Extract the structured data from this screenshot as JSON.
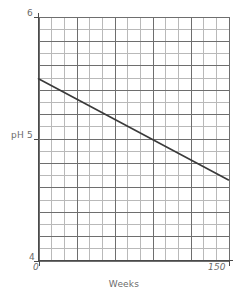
{
  "chart_data": {
    "type": "line",
    "title": "",
    "subtitle": "",
    "xlabel": "Weeks",
    "ylabel": "pH",
    "xlim": [
      0,
      150
    ],
    "ylim": [
      4,
      6
    ],
    "grid": true,
    "legend": null,
    "x_ticks": [
      {
        "value": 0,
        "label": "0"
      },
      {
        "value": 150,
        "label": "150"
      }
    ],
    "y_ticks": [
      {
        "value": 6,
        "label": "6"
      },
      {
        "value": 5,
        "label": "pH 5"
      },
      {
        "value": 4,
        "label": "4"
      }
    ],
    "grid_columns": 15,
    "grid_rows": 20,
    "major_grid_every_column": 3,
    "major_grid_every_row": 2,
    "series": [
      {
        "name": "pH decline",
        "x": [
          0,
          150
        ],
        "values": [
          5.49,
          4.66
        ]
      }
    ],
    "annotations": []
  },
  "axes": {
    "y_top_label": "6",
    "y_mid_label": "pH 5",
    "y_bottom_label": "4",
    "x_start_label": "0",
    "x_end_label": "150",
    "x_title": "Weeks"
  },
  "colors": {
    "background": "#ffffff",
    "grid_minor": "#b9b9b9",
    "grid_major": "#6e6e6e",
    "axis": "#4a4a4a",
    "series_line": "#3a3a3a",
    "text": "#6b6b6b"
  }
}
